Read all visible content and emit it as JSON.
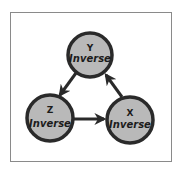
{
  "diagram": {
    "type": "cycle",
    "colors": {
      "node_fill": "#b9b9b9",
      "node_stroke": "#2a2a2a",
      "arrow": "#2a2a2a",
      "frame": "#8a8a8a",
      "text": "#1c1c1c"
    },
    "nodes": [
      {
        "id": "y",
        "letter": "Y",
        "word": "Inverse"
      },
      {
        "id": "z",
        "letter": "Z",
        "word": "Inverse"
      },
      {
        "id": "x",
        "letter": "X",
        "word": "Inverse"
      }
    ],
    "edges": [
      {
        "from": "y",
        "to": "z"
      },
      {
        "from": "z",
        "to": "x"
      },
      {
        "from": "x",
        "to": "y"
      }
    ]
  }
}
